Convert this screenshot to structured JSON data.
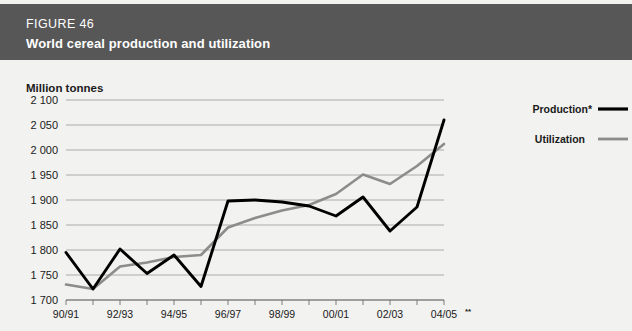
{
  "figure": {
    "number": "FIGURE 46",
    "title": "World cereal production and utilization"
  },
  "axis": {
    "y_title": "Million tonnes",
    "y_ticks": [
      "2 100",
      "2 050",
      "2 000",
      "1 950",
      "1 900",
      "1 850",
      "1 800",
      "1 750",
      "1 700"
    ],
    "x_ticks": [
      "90/91",
      "92/93",
      "94/95",
      "96/97",
      "98/99",
      "00/01",
      "02/03",
      "04/05"
    ],
    "x_last_superscript": "**"
  },
  "legend": {
    "production_label": "Production*",
    "utilization_label": "Utilization"
  },
  "colors": {
    "header_bg": "#575757",
    "panel_bg": "#f2f2f0",
    "production_line": "#000000",
    "utilization_line": "#8c8c8c",
    "gridline": "#9a9a9a",
    "text": "#1a1a1a"
  },
  "chart_data": {
    "type": "line",
    "title": "World cereal production and utilization",
    "xlabel": "",
    "ylabel": "Million tonnes",
    "ylim": [
      1700,
      2100
    ],
    "ytick_step": 50,
    "grid": true,
    "legend_position": "right",
    "categories": [
      "90/91",
      "91/92",
      "92/93",
      "93/94",
      "94/95",
      "95/96",
      "96/97",
      "97/98",
      "98/99",
      "99/00",
      "00/01",
      "01/02",
      "02/03",
      "03/04",
      "04/05"
    ],
    "series": [
      {
        "name": "Production*",
        "values": [
          1795,
          1722,
          1802,
          1753,
          1790,
          1727,
          1898,
          1900,
          1896,
          1888,
          1868,
          1906,
          1838,
          1886,
          2060
        ]
      },
      {
        "name": "Utilization",
        "values": [
          1731,
          1722,
          1767,
          1775,
          1786,
          1790,
          1845,
          1864,
          1879,
          1890,
          1912,
          1951,
          1932,
          1968,
          2012
        ]
      }
    ],
    "notes": [
      "* Production",
      "** 04/05 forecast"
    ]
  }
}
